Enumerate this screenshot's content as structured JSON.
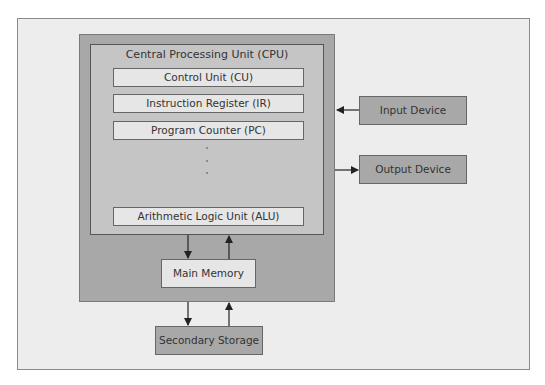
{
  "diagram": {
    "cpu": {
      "title": "Central Processing Unit (CPU)",
      "components": [
        {
          "label": "Control Unit (CU)"
        },
        {
          "label": "Instruction Register (IR)"
        },
        {
          "label": "Program Counter (PC)"
        },
        {
          "label": "Arithmetic Logic Unit (ALU)"
        }
      ],
      "ellipsis": "⋮"
    },
    "main_memory": {
      "label": "Main Memory"
    },
    "secondary_storage": {
      "label": "Secondary Storage"
    },
    "input_device": {
      "label": "Input Device"
    },
    "output_device": {
      "label": "Output Device"
    },
    "colors": {
      "frame_bg": "#ededed",
      "outer_box": "#a8a8a8",
      "cpu_box": "#c5c5c5",
      "component_box": "#e6e6e6",
      "device_box": "#a8a8a8",
      "arrow": "#222222"
    },
    "connections": [
      {
        "from": "Input Device",
        "to": "Computer",
        "direction": "left"
      },
      {
        "from": "Computer",
        "to": "Output Device",
        "direction": "right"
      },
      {
        "from": "CPU",
        "to": "Main Memory",
        "direction": "down"
      },
      {
        "from": "Main Memory",
        "to": "CPU",
        "direction": "up"
      },
      {
        "from": "Main Memory",
        "to": "Secondary Storage",
        "direction": "down"
      },
      {
        "from": "Secondary Storage",
        "to": "Main Memory",
        "direction": "up"
      }
    ]
  }
}
